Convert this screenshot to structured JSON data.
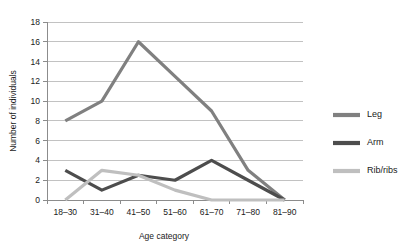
{
  "chart_data": {
    "type": "line",
    "title": "",
    "xlabel": "Age category",
    "ylabel": "Number of individuals",
    "categories": [
      "18–30",
      "31–40",
      "41–50",
      "51–60",
      "61–70",
      "71–80",
      "81–90"
    ],
    "ylim": [
      0,
      18
    ],
    "ytick_values": [
      0,
      2,
      4,
      6,
      8,
      10,
      12,
      14,
      16,
      18
    ],
    "ytick_labels": [
      "0",
      "2",
      "4",
      "6",
      "8",
      "10",
      "12",
      "14",
      "16",
      "18"
    ],
    "grid": true,
    "legend_position": "right",
    "series": [
      {
        "name": "Leg",
        "color": "#808080",
        "values": [
          8,
          10,
          16,
          12.5,
          9,
          3,
          0
        ]
      },
      {
        "name": "Arm",
        "color": "#4d4d4d",
        "values": [
          3,
          1,
          2.5,
          2,
          4,
          2,
          0
        ]
      },
      {
        "name": "Rib/ribs",
        "color": "#bfbfbf",
        "values": [
          0,
          3,
          2.5,
          1,
          0,
          0,
          0
        ]
      }
    ]
  },
  "legend": {
    "entries": [
      {
        "label": "Leg",
        "color": "#808080"
      },
      {
        "label": "Arm",
        "color": "#4d4d4d"
      },
      {
        "label": "Rib/ribs",
        "color": "#bfbfbf"
      }
    ]
  },
  "axes": {
    "x_title": "Age category",
    "y_title": "Number of individuals"
  },
  "colors": {
    "background": "#ffffff",
    "grid": "#b3b3b3",
    "axis": "#8c8c8c",
    "text": "#1a1a1a"
  }
}
